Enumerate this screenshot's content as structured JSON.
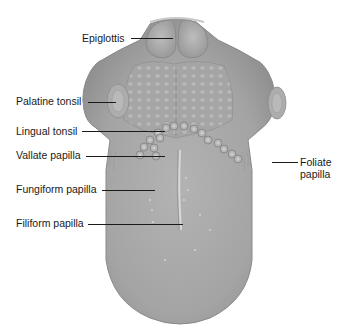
{
  "figure": {
    "colors": {
      "tissue": "#a9a9a9",
      "tissue_dark": "#8e8e8e",
      "tissue_light": "#c4c4c4",
      "outline": "#7a7a7a",
      "label_text": "#1a1a1a",
      "background": "#ffffff"
    },
    "labels": [
      {
        "id": "epiglottis",
        "text": "Epiglottis"
      },
      {
        "id": "palatine-tonsil",
        "text": "Palatine tonsil"
      },
      {
        "id": "lingual-tonsil",
        "text": "Lingual tonsil"
      },
      {
        "id": "vallate-papilla",
        "text": "Vallate papilla"
      },
      {
        "id": "fungiform-papilla",
        "text": "Fungiform papilla"
      },
      {
        "id": "filiform-papilla",
        "text": "Filiform papilla"
      },
      {
        "id": "foliate-papilla",
        "text": "Foliate\npapilla",
        "line1": "Foliate",
        "line2": "papilla"
      }
    ]
  }
}
